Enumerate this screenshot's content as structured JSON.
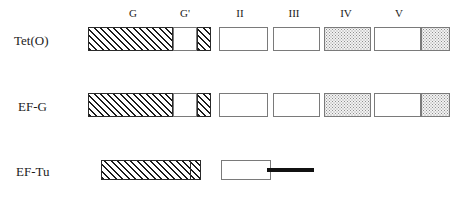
{
  "figure": {
    "type": "protein-domain-architecture-diagram",
    "background_color": "#ffffff",
    "width": 461,
    "height": 202
  },
  "domain_headers": [
    {
      "label": "G",
      "center_x": 133,
      "y": 8
    },
    {
      "label": "G'",
      "center_x": 185,
      "y": 8
    },
    {
      "label": "II",
      "center_x": 240,
      "y": 8
    },
    {
      "label": "III",
      "center_x": 294,
      "y": 8
    },
    {
      "label": "IV",
      "center_x": 346,
      "y": 8
    },
    {
      "label": "V",
      "center_x": 399,
      "y": 8
    }
  ],
  "rows": [
    {
      "name": "Tet(O)",
      "label": "Tet(O)",
      "label_x": 14,
      "label_y": 34,
      "box_top": 27,
      "box_height": 24,
      "segments": [
        {
          "domain": "G",
          "fill": "hatch",
          "x": 88,
          "width": 85
        },
        {
          "domain": "G",
          "fill": "plain",
          "x": 173,
          "width": 24
        },
        {
          "domain": "G'",
          "fill": "hatch",
          "x": 197,
          "width": 14
        },
        {
          "domain": "II",
          "fill": "plain",
          "x": 219,
          "width": 49
        },
        {
          "domain": "III",
          "fill": "plain",
          "x": 273,
          "width": 47
        },
        {
          "domain": "IV",
          "fill": "dots",
          "x": 324,
          "width": 47
        },
        {
          "domain": "V",
          "fill": "plain",
          "x": 374,
          "width": 47
        },
        {
          "domain": "V",
          "fill": "dots",
          "x": 421,
          "width": 29
        }
      ],
      "dividers": [],
      "bars": []
    },
    {
      "name": "EF-G",
      "label": "EF-G",
      "label_x": 18,
      "label_y": 100,
      "box_top": 93,
      "box_height": 24,
      "segments": [
        {
          "domain": "G",
          "fill": "hatch",
          "x": 88,
          "width": 85
        },
        {
          "domain": "G",
          "fill": "plain",
          "x": 173,
          "width": 24
        },
        {
          "domain": "G'",
          "fill": "hatch",
          "x": 197,
          "width": 14
        },
        {
          "domain": "II",
          "fill": "plain",
          "x": 219,
          "width": 49
        },
        {
          "domain": "III",
          "fill": "plain",
          "x": 273,
          "width": 47
        },
        {
          "domain": "IV",
          "fill": "dots",
          "x": 324,
          "width": 47
        },
        {
          "domain": "V",
          "fill": "plain",
          "x": 374,
          "width": 47
        },
        {
          "domain": "V",
          "fill": "dots",
          "x": 421,
          "width": 29
        }
      ],
      "dividers": [],
      "bars": []
    },
    {
      "name": "EF-Tu",
      "label": "EF-Tu",
      "label_x": 16,
      "label_y": 165,
      "box_top": 160,
      "box_height": 20,
      "segments": [
        {
          "domain": "G",
          "fill": "hatch",
          "x": 101,
          "width": 100
        },
        {
          "domain": "II",
          "fill": "plain",
          "x": 221,
          "width": 50
        }
      ],
      "dividers": [
        {
          "x": 190,
          "top": 160,
          "height": 20
        }
      ],
      "bars": [
        {
          "domain": "III",
          "x": 267,
          "y": 168,
          "width": 47,
          "height": 4,
          "color": "#111111"
        }
      ]
    }
  ],
  "legend_colors": {
    "hatch_line": "#1c1c1c",
    "dot_fill": "#8f8f8f",
    "box_border": "#7a7a7a",
    "bar": "#111111",
    "text": "#1b1b1b"
  }
}
